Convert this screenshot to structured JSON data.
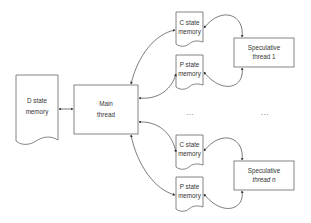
{
  "diagram": {
    "nodes": {
      "d_state": {
        "line1": "D state",
        "line2": "memory",
        "shape": "document"
      },
      "main_thread": {
        "line1": "Main",
        "line2": "thread",
        "shape": "rectangle"
      },
      "c_state_1": {
        "line1": "C state",
        "line2": "memory",
        "shape": "document"
      },
      "p_state_1": {
        "line1": "P state",
        "line2": "memory",
        "shape": "document"
      },
      "spec_1": {
        "line1": "Speculative",
        "line2": "thread 1",
        "shape": "rectangle"
      },
      "c_state_n": {
        "line1": "C state",
        "line2": "memory",
        "shape": "document"
      },
      "p_state_n": {
        "line1": "P state",
        "line2": "memory",
        "shape": "document"
      },
      "spec_n": {
        "line1": "Speculative",
        "line2": "thread n",
        "shape": "rectangle"
      }
    },
    "ellipsis": {
      "memory_column": "...",
      "thread_column": "..."
    },
    "edges": [
      {
        "from": "d_state",
        "to": "main_thread",
        "direction": "bidirectional"
      },
      {
        "from": "main_thread",
        "to": "c_state_1",
        "direction": "bidirectional"
      },
      {
        "from": "main_thread",
        "to": "p_state_1",
        "direction": "bidirectional"
      },
      {
        "from": "c_state_1",
        "to": "spec_1",
        "direction": "bidirectional"
      },
      {
        "from": "p_state_1",
        "to": "spec_1",
        "direction": "bidirectional"
      },
      {
        "from": "main_thread",
        "to": "c_state_n",
        "direction": "bidirectional"
      },
      {
        "from": "main_thread",
        "to": "p_state_n",
        "direction": "bidirectional"
      },
      {
        "from": "c_state_n",
        "to": "spec_n",
        "direction": "bidirectional"
      },
      {
        "from": "p_state_n",
        "to": "spec_n",
        "direction": "bidirectional"
      }
    ],
    "colors": {
      "stroke": "#666666",
      "text": "#333333",
      "background": "#ffffff"
    }
  }
}
